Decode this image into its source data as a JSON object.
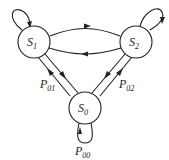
{
  "diagram": {
    "type": "markov-chain-state-diagram",
    "nodes": [
      {
        "id": "S1",
        "base": "S",
        "sub": "1",
        "cx": 34,
        "cy": 42,
        "r": 16
      },
      {
        "id": "S2",
        "base": "S",
        "sub": "2",
        "cx": 136,
        "cy": 42,
        "r": 16
      },
      {
        "id": "S0",
        "base": "S",
        "sub": "0",
        "cx": 85,
        "cy": 108,
        "r": 16
      }
    ],
    "edges": [
      {
        "from": "S1",
        "to": "S1",
        "kind": "self-loop"
      },
      {
        "from": "S2",
        "to": "S2",
        "kind": "self-loop"
      },
      {
        "from": "S0",
        "to": "S0",
        "kind": "self-loop",
        "label": {
          "base": "P",
          "sub": "00"
        }
      },
      {
        "from": "S1",
        "to": "S2",
        "kind": "arc"
      },
      {
        "from": "S2",
        "to": "S1",
        "kind": "arc"
      },
      {
        "from": "S1",
        "to": "S0",
        "kind": "line"
      },
      {
        "from": "S0",
        "to": "S1",
        "kind": "line",
        "label": {
          "base": "P",
          "sub": "01"
        }
      },
      {
        "from": "S2",
        "to": "S0",
        "kind": "line"
      },
      {
        "from": "S0",
        "to": "S2",
        "kind": "line",
        "label": {
          "base": "P",
          "sub": "02"
        }
      }
    ],
    "labels": {
      "s1": {
        "base": "S",
        "sub": "1"
      },
      "s2": {
        "base": "S",
        "sub": "2"
      },
      "s0": {
        "base": "S",
        "sub": "0"
      },
      "p01": {
        "base": "P",
        "sub": "01"
      },
      "p02": {
        "base": "P",
        "sub": "02"
      },
      "p00": {
        "base": "P",
        "sub": "00"
      }
    }
  }
}
